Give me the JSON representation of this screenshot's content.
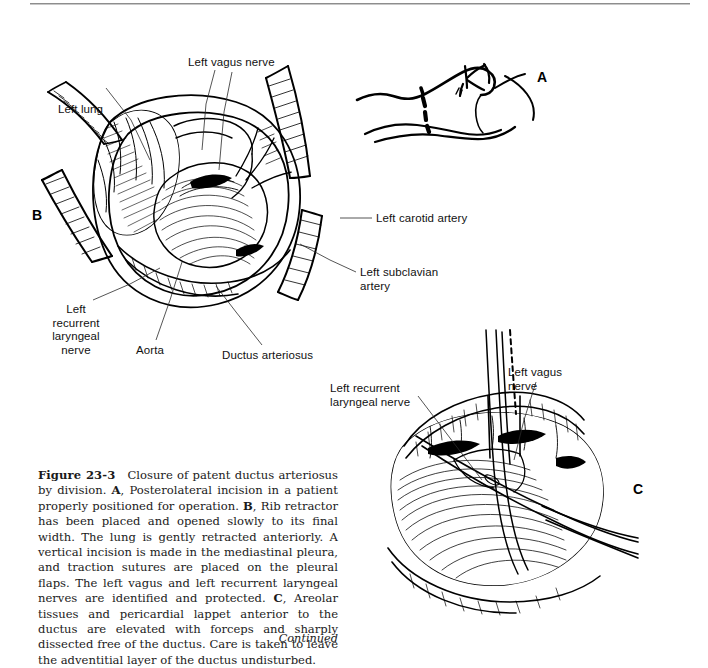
{
  "page": {
    "background_color": "#ffffff",
    "ink_color": "#000000",
    "rule_color": "#8d8d8d"
  },
  "figure": {
    "number": "Figure 23-3",
    "title_text": "Closure of patent ductus arteriosus by division.",
    "continued_note": "Continued"
  },
  "caption": {
    "fig_number": "Figure 23-3",
    "body": "Closure of patent ductus arteriosus by division. A, Posterolateral incision in a patient properly positioned for operation. B, Rib retractor has been placed and opened slowly to its final width. The lung is gently retracted anteriorly. A vertical incision is made in the mediastinal pleura, and traction sutures are placed on the pleural flaps. The left vagus and left recurrent laryngeal nerves are identified and protected. C, Areolar tissues and pericardial lappet anterior to the ductus are elevated with forceps and sharply dissected free of the ductus. Care is taken to leave the adventitial layer of the ductus undisturbed.",
    "segments": [
      {
        "bold": "Figure 23-3",
        "text": ""
      },
      {
        "bold": "",
        "text": "Closure of patent ductus arteriosus by division. "
      },
      {
        "bold": "A",
        "text": ", Posterolateral incision in a patient properly positioned for operation. "
      },
      {
        "bold": "B",
        "text": ", Rib retractor has been placed and opened slowly to its final width. The lung is gently retracted anteriorly. A vertical incision is made in the mediastinal pleura, and traction sutures are placed on the pleural flaps. The left vagus and left recurrent laryngeal nerves are identified and protected. "
      },
      {
        "bold": "C",
        "text": ", Areolar tissues and pericardial lappet anterior to the ductus are elevated with forceps and sharply dissected free of the ductus. Care is taken to leave the adventitial layer of the ductus undisturbed."
      }
    ]
  },
  "panels": [
    {
      "id": "A",
      "letter": "A",
      "description": "Patient in lateral decubitus position with dashed posterolateral incision line"
    },
    {
      "id": "B",
      "letter": "B",
      "description": "Rib retractor opened, lung retracted, mediastinal pleura incised with traction sutures"
    },
    {
      "id": "C",
      "letter": "C",
      "description": "Forceps elevating areolar tissue and pericardial lappet anterior to the ductus"
    }
  ],
  "labels_panel_b": [
    {
      "id": "left-vagus-nerve",
      "text": "Left vagus nerve"
    },
    {
      "id": "left-lung",
      "text": "Left lung"
    },
    {
      "id": "left-carotid-artery",
      "text": "Left carotid artery"
    },
    {
      "id": "left-subclavian-artery",
      "text": "Left subclavian\nartery"
    },
    {
      "id": "left-recurrent-laryngeal-nerve",
      "text": "Left\nrecurrent\nlaryngeal\nnerve"
    },
    {
      "id": "aorta",
      "text": "Aorta"
    },
    {
      "id": "ductus-arteriosus",
      "text": "Ductus arteriosus"
    }
  ],
  "labels_panel_c": [
    {
      "id": "left-vagus-nerve-c",
      "text": "Left vagus\nnerve"
    },
    {
      "id": "left-recurrent-laryngeal-nerve-c",
      "text": "Left recurrent\nlaryngeal nerve"
    }
  ]
}
